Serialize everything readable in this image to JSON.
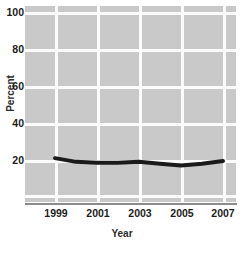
{
  "chart_data": {
    "type": "line",
    "title": "",
    "xlabel": "Year",
    "ylabel": "Percent",
    "x": [
      1999,
      2000,
      2001,
      2002,
      2003,
      2004,
      2005,
      2006,
      2007
    ],
    "values": [
      21,
      19,
      18.5,
      18.5,
      19,
      18,
      17,
      18,
      19.5
    ],
    "series": [
      {
        "name": "Percent",
        "values": [
          21,
          19,
          18.5,
          18.5,
          19,
          18,
          17,
          18,
          19.5
        ]
      }
    ],
    "xlim": [
      1999,
      2007
    ],
    "ylim": [
      0,
      106
    ],
    "x_tick_labels": [
      "1999",
      "2001",
      "2003",
      "2005",
      "2007"
    ],
    "x_tick_values": [
      1999,
      2001,
      2003,
      2005,
      2007
    ],
    "y_tick_labels": [
      "100",
      "80",
      "60",
      "40",
      "20"
    ],
    "y_tick_values": [
      100,
      80,
      60,
      40,
      20
    ],
    "grid": true,
    "legend": "none",
    "line_color": "#1a1a1a",
    "plot_background": "#c9c9c9",
    "grid_color": "#fbfbfb"
  }
}
